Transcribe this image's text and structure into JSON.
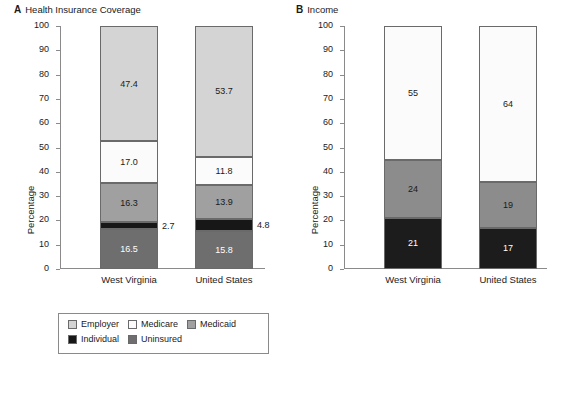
{
  "panels": [
    {
      "letter": "A",
      "title": "Health Insurance Coverage",
      "ylabel": "Percentage",
      "yticks": [
        "100",
        "90",
        "80",
        "70",
        "60",
        "50",
        "40",
        "30",
        "20",
        "10",
        "0"
      ],
      "categories": [
        "West Virginia",
        "United States"
      ],
      "legend": {
        "rows": [
          [
            {
              "label": "Employer",
              "color": "#d4d4d4"
            },
            {
              "label": "Medicare",
              "color": "#fbfbfb"
            },
            {
              "label": "Medicaid",
              "color": "#a0a0a0"
            }
          ],
          [
            {
              "label": "Individual",
              "color": "#171717"
            },
            {
              "label": "Uninsured",
              "color": "#6e6e6e"
            }
          ]
        ]
      }
    },
    {
      "letter": "B",
      "title": "Income",
      "ylabel": "Percentage",
      "yticks": [
        "100",
        "90",
        "80",
        "70",
        "60",
        "50",
        "40",
        "30",
        "20",
        "10",
        "0"
      ],
      "categories": [
        "West Virginia",
        "United States"
      ],
      "legend": {
        "rows": [
          [
            {
              "label": "Non-poor (≥200% of federal poverty guidelines)",
              "color": "#fbfbfb"
            }
          ],
          [
            {
              "label": "Near-poor (100–199% of federal poverty guidelines)",
              "color": "#8c8c8c"
            }
          ],
          [
            {
              "label": "Poor (below federal poverty guidelines)",
              "color": "#1c1c1c"
            }
          ]
        ]
      }
    }
  ],
  "chart_data": [
    {
      "type": "bar",
      "subtype": "stacked",
      "panel": "A",
      "title": "Health Insurance Coverage",
      "xlabel": "",
      "ylabel": "Percentage",
      "ylim": [
        0,
        100
      ],
      "yticks": [
        0,
        10,
        20,
        30,
        40,
        50,
        60,
        70,
        80,
        90,
        100
      ],
      "grid": false,
      "legend_position": "below-plot",
      "categories": [
        "West Virginia",
        "United States"
      ],
      "stack_order_bottom_to_top": [
        "Uninsured",
        "Individual",
        "Medicaid",
        "Medicare",
        "Employer"
      ],
      "series": [
        {
          "name": "Uninsured",
          "color": "#6e6e6e",
          "values": [
            16.5,
            15.8
          ]
        },
        {
          "name": "Individual",
          "color": "#171717",
          "values": [
            2.7,
            4.8
          ]
        },
        {
          "name": "Medicaid",
          "color": "#a0a0a0",
          "values": [
            16.3,
            13.9
          ]
        },
        {
          "name": "Medicare",
          "color": "#fbfbfb",
          "values": [
            17.0,
            11.8
          ]
        },
        {
          "name": "Employer",
          "color": "#d4d4d4",
          "values": [
            47.4,
            53.7
          ]
        }
      ],
      "bars": [
        {
          "category": "West Virginia",
          "segments": [
            {
              "name": "Uninsured",
              "value": 16.5,
              "label": "16.5",
              "color": "#6e6e6e",
              "text_color": "#ffffff",
              "label_position": "inside"
            },
            {
              "name": "Individual",
              "value": 2.7,
              "label": "2.7",
              "color": "#171717",
              "text_color": "#1a1a1a",
              "label_position": "outside-right"
            },
            {
              "name": "Medicaid",
              "value": 16.3,
              "label": "16.3",
              "color": "#a0a0a0",
              "text_color": "#1a1a1a",
              "label_position": "inside"
            },
            {
              "name": "Medicare",
              "value": 17.0,
              "label": "17.0",
              "color": "#fbfbfb",
              "text_color": "#1a1a1a",
              "label_position": "inside"
            },
            {
              "name": "Employer",
              "value": 47.4,
              "label": "47.4",
              "color": "#d4d4d4",
              "text_color": "#1a1a1a",
              "label_position": "inside"
            }
          ]
        },
        {
          "category": "United States",
          "segments": [
            {
              "name": "Uninsured",
              "value": 15.8,
              "label": "15.8",
              "color": "#6e6e6e",
              "text_color": "#ffffff",
              "label_position": "inside"
            },
            {
              "name": "Individual",
              "value": 4.8,
              "label": "4.8",
              "color": "#171717",
              "text_color": "#1a1a1a",
              "label_position": "outside-right"
            },
            {
              "name": "Medicaid",
              "value": 13.9,
              "label": "13.9",
              "color": "#a0a0a0",
              "text_color": "#1a1a1a",
              "label_position": "inside"
            },
            {
              "name": "Medicare",
              "value": 11.8,
              "label": "11.8",
              "color": "#fbfbfb",
              "text_color": "#1a1a1a",
              "label_position": "inside"
            },
            {
              "name": "Employer",
              "value": 53.7,
              "label": "53.7",
              "color": "#d4d4d4",
              "text_color": "#1a1a1a",
              "label_position": "inside"
            }
          ]
        }
      ]
    },
    {
      "type": "bar",
      "subtype": "stacked",
      "panel": "B",
      "title": "Income",
      "xlabel": "",
      "ylabel": "Percentage",
      "ylim": [
        0,
        100
      ],
      "yticks": [
        0,
        10,
        20,
        30,
        40,
        50,
        60,
        70,
        80,
        90,
        100
      ],
      "grid": false,
      "legend_position": "below-plot",
      "categories": [
        "West Virginia",
        "United States"
      ],
      "stack_order_bottom_to_top": [
        "Poor",
        "Near-poor",
        "Non-poor"
      ],
      "series": [
        {
          "name": "Poor",
          "color": "#1c1c1c",
          "values": [
            21,
            17
          ]
        },
        {
          "name": "Near-poor",
          "color": "#8c8c8c",
          "values": [
            24,
            19
          ]
        },
        {
          "name": "Non-poor",
          "color": "#fbfbfb",
          "values": [
            55,
            64
          ]
        }
      ],
      "bars": [
        {
          "category": "West Virginia",
          "segments": [
            {
              "name": "Poor",
              "value": 21,
              "label": "21",
              "color": "#1c1c1c",
              "text_color": "#ffffff",
              "label_position": "inside"
            },
            {
              "name": "Near-poor",
              "value": 24,
              "label": "24",
              "color": "#8c8c8c",
              "text_color": "#1a1a1a",
              "label_position": "inside"
            },
            {
              "name": "Non-poor",
              "value": 55,
              "label": "55",
              "color": "#fbfbfb",
              "text_color": "#1a1a1a",
              "label_position": "inside"
            }
          ]
        },
        {
          "category": "United States",
          "segments": [
            {
              "name": "Poor",
              "value": 17,
              "label": "17",
              "color": "#1c1c1c",
              "text_color": "#ffffff",
              "label_position": "inside"
            },
            {
              "name": "Near-poor",
              "value": 19,
              "label": "19",
              "color": "#8c8c8c",
              "text_color": "#1a1a1a",
              "label_position": "inside"
            },
            {
              "name": "Non-poor",
              "value": 64,
              "label": "64",
              "color": "#fbfbfb",
              "text_color": "#1a1a1a",
              "label_position": "inside"
            }
          ]
        }
      ]
    }
  ]
}
